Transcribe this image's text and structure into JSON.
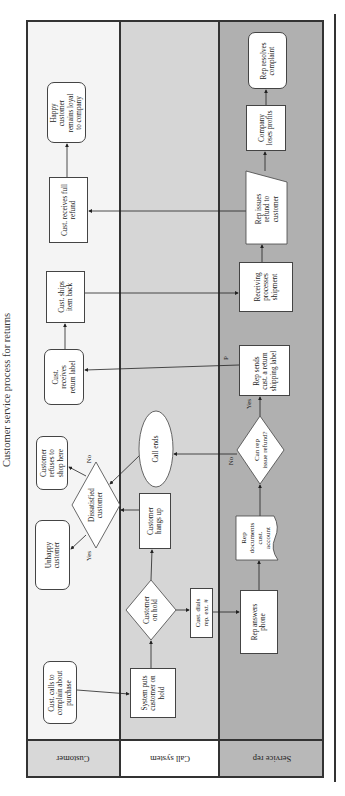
{
  "title": "Customer service process for returns",
  "lanes": [
    {
      "name": "Customer",
      "color": "#f4f4f4",
      "header_color": "#d8d8d8"
    },
    {
      "name": "Call system",
      "color": "#d6d6d6",
      "header_color": "#ffffff"
    },
    {
      "name": "Service rep",
      "color": "#b0b0b0",
      "header_color": "#b8b8b8"
    }
  ],
  "nodes": {
    "cust_calls": "Cust. calls to complain about purchase",
    "system_puts": "System puts customer on hold",
    "customer_on_hold": "Customer on hold",
    "cust_dials": "Cust. dials rep. ext. #",
    "rep_answers": "Rep answers phone",
    "rep_documents": "Rep documents cust. account",
    "customer_hangs_up": "Customer hangs up",
    "dissatisfied": "Dissatisfied customer",
    "unhappy": "Unhappy customer",
    "refuses": "Customer refuses to shop here",
    "call_ends": "Call ends",
    "can_rep": "Can rep issue refund?",
    "rep_sends": "Rep sends cust. a return shipping label",
    "cust_receives_label": "Cust. receives return label",
    "cust_ships": "Cust. ships item back",
    "receiving": "Receiving processes shipment",
    "rep_issues": "Rep issues refund to customer",
    "cust_receives_refund": "Cust. receives full refund",
    "happy": "Happy customer remains loyal to company",
    "company_loses": "Company loses profits",
    "rep_resolves": "Rep resolves complaint"
  },
  "node_lines": {
    "cust_calls": [
      "Cust. calls to",
      "complain about",
      "purchase"
    ],
    "system_puts": [
      "System puts",
      "customer on",
      "hold"
    ],
    "customer_on_hold": [
      "Customer",
      "on hold"
    ],
    "cust_dials": [
      "Cust. dials",
      "rep. ext. #"
    ],
    "rep_answers": [
      "Rep answers",
      "phone"
    ],
    "rep_documents": [
      "Rep",
      "documents",
      "cust.",
      "account"
    ],
    "customer_hangs_up": [
      "Customer",
      "hangs up"
    ],
    "dissatisfied": [
      "Dissatisfied",
      "customer"
    ],
    "unhappy": [
      "Unhappy",
      "customer"
    ],
    "refuses": [
      "Customer",
      "refuses to",
      "shop here"
    ],
    "call_ends": [
      "Call ends"
    ],
    "can_rep": [
      "Can rep",
      "issue refund?"
    ],
    "rep_sends": [
      "Rep sends",
      "cust. a return",
      "shipping label"
    ],
    "cust_receives_label": [
      "Cust.",
      "receives",
      "return label"
    ],
    "cust_ships": [
      "Cust. ships",
      "item back"
    ],
    "receiving": [
      "Receiving",
      "processes",
      "shipment"
    ],
    "rep_issues": [
      "Rep issues",
      "refund to",
      "customer"
    ],
    "cust_receives_refund": [
      "Cust. receives full",
      "refund"
    ],
    "happy": [
      "Happy",
      "customer",
      "remains loyal",
      "to company"
    ],
    "company_loses": [
      "Company",
      "loses profits"
    ],
    "rep_resolves": [
      "Rep resolves",
      "complaint"
    ]
  },
  "edge_labels": {
    "dissatisfied_yes": "Yes",
    "dissatisfied_no": "No",
    "can_rep_yes": "Yes",
    "can_rep_no": "No",
    "return_label_p": "P"
  }
}
